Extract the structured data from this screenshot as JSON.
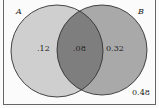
{
  "diagram": {
    "type": "venn",
    "sets": [
      {
        "name": "A",
        "label": "A"
      },
      {
        "name": "B",
        "label": "B"
      }
    ],
    "regions": {
      "a_only": ".12",
      "intersection": ".08",
      "b_only": "0.32",
      "outside": "0.48"
    },
    "colors": {
      "circle_a": "#cfcfcf",
      "circle_b": "#a9a9a9",
      "intersection": "#7e7e7e",
      "background": "#fbfbfb",
      "outline": "#333333"
    }
  }
}
